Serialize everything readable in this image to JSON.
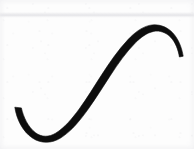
{
  "document": {
    "kind": "scanned-figure",
    "title": "S-shaped curve",
    "caption": "",
    "width_px": 194,
    "height_px": 149
  },
  "colors": {
    "background": "#fdfdfd",
    "ink": "#0d0d0d",
    "ink_soft": "#1a1a1a",
    "scanline": "#e6e6e9",
    "grain": "#c8c8cd"
  },
  "figure": {
    "name": "s-curve",
    "stroke_color": "#0d0d0d",
    "stroke_min_width": 3,
    "stroke_max_width": 7,
    "anchors": {
      "left_terminus": {
        "x": 16,
        "y": 109
      },
      "bottom_trough": {
        "x": 45,
        "y": 142
      },
      "inflection": {
        "x": 98,
        "y": 78
      },
      "top_apex": {
        "x": 152,
        "y": 15
      },
      "right_terminus": {
        "x": 181,
        "y": 42
      }
    },
    "outline_path": "M 14.8 107.2 C 16.6 119.2 22.6 131.4 32.4 138.0 C 41.2 144.0 52.0 143.4 60.6 138.0 C 72.0 130.8 80.6 119.6 88.4 108.8 C 96.2 98.0 103.0 86.6 110.4 75.4 C 118.0 63.8 126.2 52.0 135.6 42.6 C 140.8 37.4 146.8 32.8 153.6 31.4 C 159.8 30.2 166.2 32.6 170.6 37.2 C 175.6 42.4 178.2 49.8 179.4 57.0 L 183.2 56.2 C 181.8 48.0 178.8 39.4 172.8 32.9 C 166.8 26.4 157.8 23.4 149.4 25.4 C 141.0 27.4 134.0 33.2 128.0 39.6 C 118.0 50.2 109.6 62.6 101.8 74.6 C 94.2 86.2 87.2 98.2 79.2 109.0 C 72.4 118.2 64.8 127.6 55.6 133.2 C 49.0 137.2 41.6 137.4 35.6 132.8 C 28.0 127.0 23.4 117.0 21.4 107.9 Z",
    "stroke_centerline": "M 16 109 C 18 126 27 140 44 141.5 C 60 143 72 130 82 117 C 92 104 101 89 110 76 C 120 61 130 44 141 33 C 148 26 158 22 167 27 C 176 32 180 40 181 42"
  },
  "artifacts": {
    "scanline": {
      "name": "horizontal-scan-band",
      "top_y": 12,
      "height_px": 6,
      "color": "#e6e6e9"
    }
  }
}
